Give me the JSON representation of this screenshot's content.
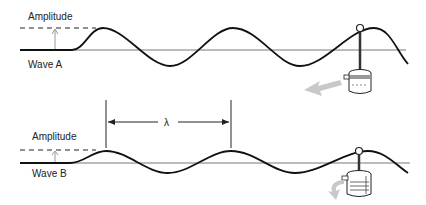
{
  "wave_a": {
    "amplitude_label": "Amplitude",
    "name_label": "Wave A"
  },
  "wave_b": {
    "amplitude_label": "Amplitude",
    "name_label": "Wave B"
  },
  "wavelength": {
    "symbol": "λ"
  },
  "colors": {
    "line": "#111111",
    "axis": "#555555",
    "arrow_shadow": "#c8c8c8"
  }
}
